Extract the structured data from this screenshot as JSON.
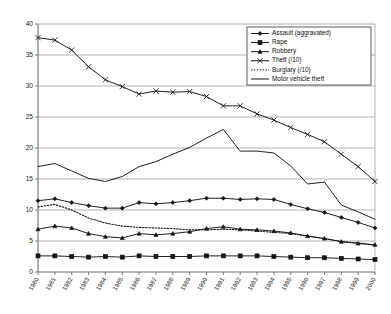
{
  "chart_data": {
    "type": "line",
    "title": "",
    "xlabel": "",
    "ylabel": "",
    "ylim": [
      0,
      40
    ],
    "ytick_step": 5,
    "yticks": [
      0,
      5,
      10,
      15,
      20,
      25,
      30,
      35,
      40
    ],
    "grid": true,
    "legend_position": "top-right",
    "categories": [
      "1980",
      "1981",
      "1982",
      "1983",
      "1984",
      "1985",
      "1986",
      "1987",
      "1988",
      "1989",
      "1990",
      "1991",
      "1992",
      "1993",
      "1994",
      "1995",
      "1996",
      "1997",
      "1998",
      "1999",
      "2000"
    ],
    "series": [
      {
        "name": "Assault (aggravated)",
        "marker": "diamond",
        "style": "solid",
        "values": [
          11.5,
          11.8,
          11.2,
          10.7,
          10.3,
          10.3,
          11.2,
          11.0,
          11.2,
          11.5,
          11.9,
          11.9,
          11.7,
          11.8,
          11.7,
          10.9,
          10.2,
          9.6,
          8.8,
          8.0,
          7.1
        ]
      },
      {
        "name": "Rape",
        "marker": "square",
        "style": "solid",
        "values": [
          2.6,
          2.6,
          2.5,
          2.4,
          2.5,
          2.4,
          2.6,
          2.5,
          2.5,
          2.5,
          2.6,
          2.6,
          2.6,
          2.6,
          2.5,
          2.4,
          2.3,
          2.3,
          2.2,
          2.1,
          2.0
        ]
      },
      {
        "name": "Robbery",
        "marker": "triangle",
        "style": "solid",
        "values": [
          6.9,
          7.4,
          7.1,
          6.2,
          5.7,
          5.5,
          6.2,
          6.0,
          6.2,
          6.5,
          7.0,
          7.3,
          6.9,
          6.8,
          6.6,
          6.3,
          5.8,
          5.4,
          4.9,
          4.6,
          4.4
        ]
      },
      {
        "name": "Theft (/10)",
        "marker": "x",
        "style": "solid",
        "values": [
          37.8,
          37.4,
          35.8,
          33.1,
          31.0,
          29.9,
          28.7,
          29.2,
          29.0,
          29.1,
          28.3,
          26.8,
          26.8,
          25.5,
          24.5,
          23.3,
          22.2,
          21.0,
          19.0,
          17.0,
          14.6
        ]
      },
      {
        "name": "Burglary (/10)",
        "marker": "none",
        "style": "dotted",
        "values": [
          10.5,
          10.9,
          10.0,
          8.7,
          7.9,
          7.4,
          7.2,
          7.1,
          7.0,
          6.8,
          6.8,
          6.9,
          6.8,
          6.6,
          6.4,
          6.2,
          5.8,
          5.4,
          4.9,
          4.7,
          4.3
        ]
      },
      {
        "name": "Motor vehicle theft",
        "marker": "none",
        "style": "plain",
        "values": [
          17.0,
          17.5,
          16.3,
          15.1,
          14.6,
          15.4,
          17.0,
          17.8,
          19.0,
          20.1,
          21.6,
          23.0,
          19.5,
          19.5,
          19.2,
          17.1,
          14.2,
          14.5,
          10.8,
          9.7,
          8.5
        ]
      }
    ]
  }
}
